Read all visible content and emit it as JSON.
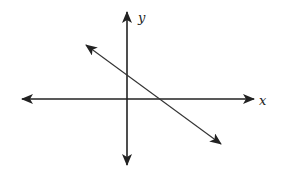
{
  "diagram": {
    "type": "coordinate-plane",
    "axes": {
      "x_label": "x",
      "y_label": "y",
      "x_arrows": "both-ends",
      "y_arrows": "both-ends",
      "ticks": false,
      "grid": false
    },
    "line": {
      "description": "straight line with negative slope, arrows at both ends",
      "slope_sign": "negative",
      "y_intercept_sign": "positive",
      "x_intercept_sign": "positive",
      "passes_through_quadrants": [
        "II",
        "I",
        "IV"
      ]
    },
    "colors": {
      "axis": "#222222",
      "line": "#333333",
      "background": "#ffffff"
    }
  }
}
